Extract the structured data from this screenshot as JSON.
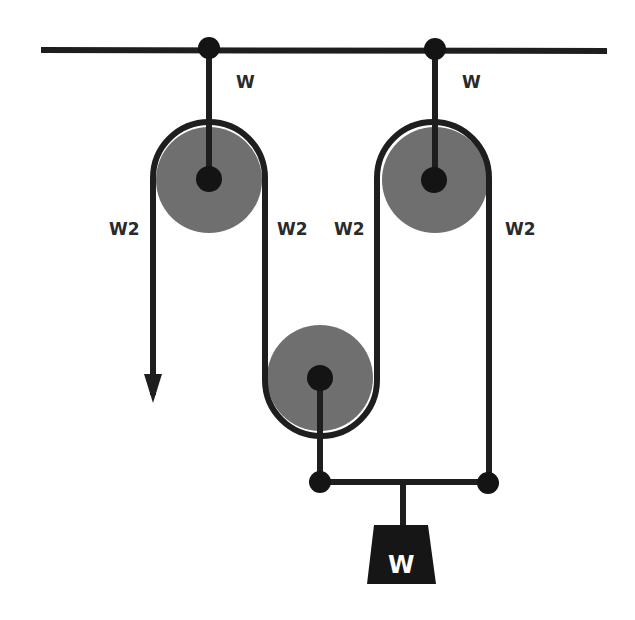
{
  "diagram": {
    "colors": {
      "rope": "#1e1e1e",
      "pulley_fill": "#6f6f6f",
      "pin": "#141414",
      "weight": "#161616",
      "label": "#2a2a2a"
    },
    "labels": {
      "left_anchor_tension": "W",
      "right_anchor_tension": "W",
      "free_end_tension": "W2",
      "segment_2_tension": "W2",
      "segment_3_tension": "W2",
      "segment_4_tension": "W2",
      "weight": "W"
    }
  }
}
